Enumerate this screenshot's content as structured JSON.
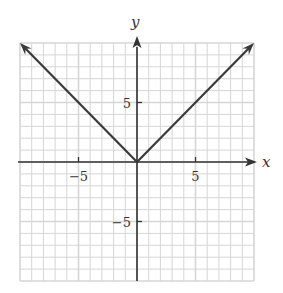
{
  "chart_data": {
    "type": "line",
    "title": "",
    "function": "y = |x|",
    "xlabel": "x",
    "ylabel": "y",
    "xlim": [
      -10,
      10
    ],
    "ylim": [
      -10,
      10
    ],
    "grid": true,
    "grid_step": 1,
    "x_ticks": [
      {
        "value": -5,
        "label": "−5"
      },
      {
        "value": 5,
        "label": "5"
      }
    ],
    "y_ticks": [
      {
        "value": 5,
        "label": "5"
      },
      {
        "value": -5,
        "label": "−5"
      }
    ],
    "series": [
      {
        "name": "left branch",
        "x": [
          0,
          -10
        ],
        "y": [
          0,
          10
        ],
        "arrow_end": true
      },
      {
        "name": "right branch",
        "x": [
          0,
          10
        ],
        "y": [
          0,
          10
        ],
        "arrow_end": true
      }
    ],
    "legend": null
  },
  "colors": {
    "grid": "#d6d6d6",
    "axis": "#333333",
    "curve": "#3a3a3a",
    "background": "#ffffff"
  },
  "layout": {
    "origin_px": [
      137,
      162
    ],
    "unit_px_x": 11.7,
    "unit_px_y": 11.9
  }
}
